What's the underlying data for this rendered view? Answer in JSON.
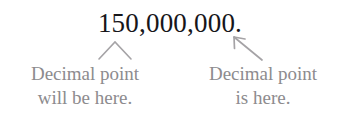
{
  "figure": {
    "type": "decimal-point-placement-annotation",
    "background_color": "#ffffff",
    "number": {
      "text": "150,000,000.",
      "color": "#17161a",
      "digits": "150000000",
      "value": 150000000,
      "trailing_decimal_point": true
    },
    "annotations": [
      {
        "id": "left",
        "marker": "caret-up-icon",
        "marker_color": "#a5a3a6",
        "points_to": "position where the decimal point will be moved to",
        "lines": [
          "Decimal point",
          "will be here."
        ],
        "text_color": "#8d8b8e"
      },
      {
        "id": "right",
        "marker": "arrow-up-left-icon",
        "marker_color": "#a5a3a6",
        "points_to": "the decimal point at the end of the number",
        "lines": [
          "Decimal point",
          "is here."
        ],
        "text_color": "#8d8b8e"
      }
    ]
  }
}
